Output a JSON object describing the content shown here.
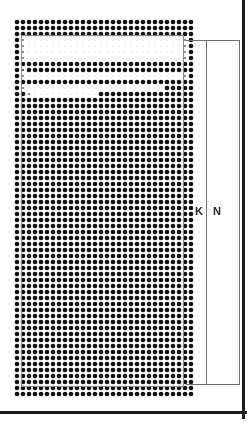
{
  "figure": {
    "kind": "halftone-dot-matrix-diagram",
    "background_color": "#ffffff",
    "ink_color": "#111111",
    "frame": {
      "rule_color": "#1b1b1b",
      "right_rule": true,
      "bottom_rule": true
    },
    "inner_rectangle": {
      "stroke_color": "#8a8a8a",
      "x": 21,
      "y": 35,
      "width": 163,
      "height": 352
    },
    "dot_grid": {
      "pitch": 6,
      "origin_x": 17,
      "origin_y": 22,
      "columns": 30,
      "rows": 63,
      "max_dot_diameter": 4.6,
      "min_dot_diameter": 0.7
    },
    "dimensions": [
      {
        "label": "K",
        "name": "dimension-k",
        "bracket_top": 40,
        "bracket_bottom": 385,
        "bracket_x": 206,
        "label_x": 195,
        "label_y": 206
      },
      {
        "label": "N",
        "name": "dimension-n",
        "bracket_top": 40,
        "bracket_bottom": 385,
        "bracket_x": 239,
        "label_x": 213,
        "label_y": 206
      }
    ],
    "tick_marks": {
      "color": "#6e6e6e",
      "top_y": 40,
      "bottom_y": 384,
      "start_x": 186,
      "end_x": 240
    }
  }
}
